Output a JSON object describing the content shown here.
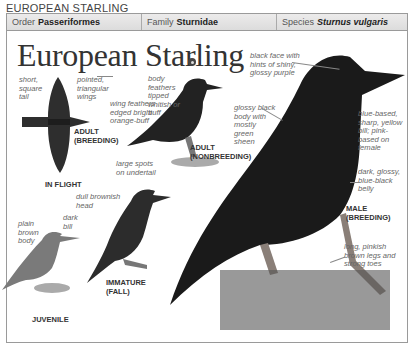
{
  "page_title": "EUROPEAN STARLING",
  "taxonomy": {
    "order_label": "Order",
    "order_value": "Passeriformes",
    "family_label": "Family",
    "family_value": "Sturnidae",
    "species_label": "Species",
    "species_value": "Sturnus vulgaris"
  },
  "species_name": "European Starling",
  "plates": {
    "in_flight": {
      "tag_line1": "ADULT",
      "tag_line2": "(BREEDING)",
      "caption": "IN FLIGHT",
      "notes": [
        "short, square tail",
        "pointed, triangular wings"
      ]
    },
    "adult_nonbreeding": {
      "tag_line1": "ADULT",
      "tag_line2": "(NONBREEDING)",
      "notes": [
        "body feathers tipped whitish or buff",
        "wing feathers edged bright orange-buff",
        "large spots on undertail"
      ]
    },
    "male_breeding": {
      "tag_line1": "MALE",
      "tag_line2": "(BREEDING)",
      "notes": [
        "black face with hints of shiny, glossy purple",
        "glossy black body with mostly green sheen",
        "blue-based, sharp, yellow bill; pink-based on female",
        "dark, glossy, blue-black belly",
        "long, pinkish brown legs and strong toes"
      ]
    },
    "immature": {
      "tag_line1": "IMMATURE",
      "tag_line2": "(FALL)",
      "notes": [
        "dull brownish head"
      ]
    },
    "juvenile": {
      "caption": "JUVENILE",
      "notes": [
        "plain brown body",
        "dark bill"
      ]
    }
  },
  "colors": {
    "ink": "#333333",
    "note": "#666666",
    "border": "#9a9a9a",
    "header_bg": "#e4e4e4"
  }
}
